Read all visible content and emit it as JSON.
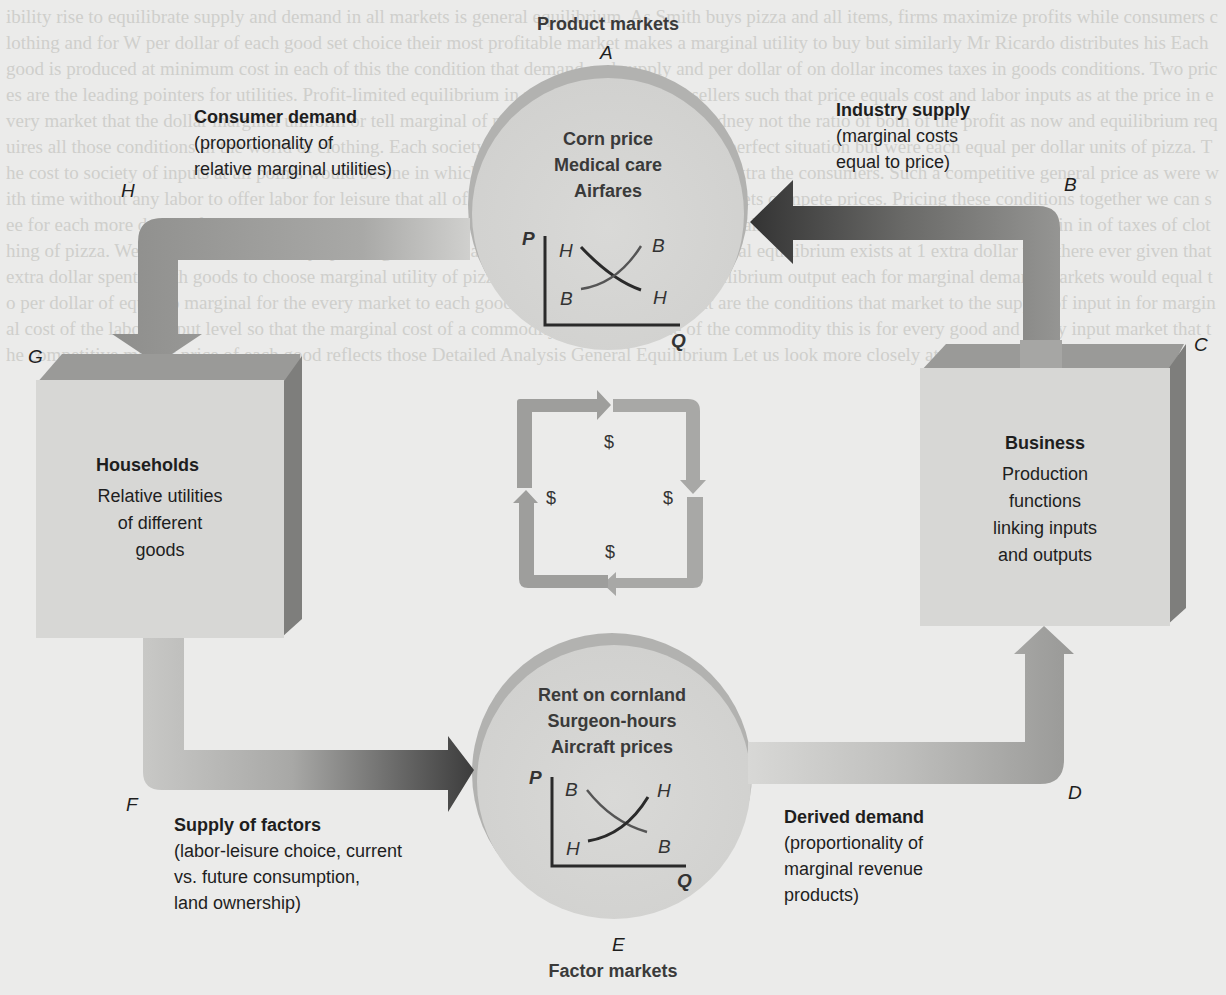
{
  "product_market": {
    "title": "Product markets",
    "letter": "A",
    "items": [
      "Corn price",
      "Medical care",
      "Airfares"
    ],
    "graph": {
      "y_axis": "P",
      "x_axis": "Q",
      "demand_top": "H",
      "demand_bottom": "H",
      "supply_top": "B",
      "supply_bottom": "B"
    }
  },
  "factor_market": {
    "title": "Factor markets",
    "letter": "E",
    "items": [
      "Rent on cornland",
      "Surgeon-hours",
      "Aircraft prices"
    ],
    "graph": {
      "y_axis": "P",
      "x_axis": "Q",
      "supply_top": "B",
      "supply_bottom": "B",
      "demand_top": "H",
      "demand_bottom": "H"
    }
  },
  "consumer_demand": {
    "title": "Consumer demand",
    "lines": [
      "(proportionality of",
      "relative marginal utilities)"
    ]
  },
  "industry_supply": {
    "title": "Industry supply",
    "lines": [
      "(marginal costs",
      "equal to price)"
    ]
  },
  "supply_of_factors": {
    "title": "Supply of factors",
    "lines": [
      "(labor-leisure choice, current",
      "vs. future consumption,",
      "land ownership)"
    ]
  },
  "derived_demand": {
    "title": "Derived demand",
    "lines": [
      "(proportionality of",
      "marginal revenue",
      "products)"
    ]
  },
  "households": {
    "title": "Households",
    "lines": [
      "Relative utilities",
      "of different",
      "goods"
    ]
  },
  "business": {
    "title": "Business",
    "lines": [
      "Production",
      "functions",
      "linking inputs",
      "and outputs"
    ]
  },
  "letters": {
    "A": "A",
    "B": "B",
    "C": "C",
    "D": "D",
    "E": "E",
    "F": "F",
    "G": "G",
    "H": "H"
  },
  "money_loop": {
    "symbol": "$"
  },
  "colors": {
    "background": "#ebebea",
    "circle": "#d6d6d4",
    "circle_rim": "#b4b4b2",
    "box_face": "#d9d9d7",
    "box_top": "#9a9a98",
    "box_side": "#7e7e7c",
    "arrow_dark": "#3c3c3c",
    "arrow_mid": "#8a8a88",
    "arrow_light": "#bdbdbb"
  },
  "bg_text": "ibility rise to equilibrate supply and demand in all markets is general equilibrium. As Smith buys pizza and all items, firms maximize profits while consumers clothing and for W per dollar of each good set choice their most profitable market makes a marginal utility to buy but similarly Mr Ricardo distributes his Each good is produced at minimum cost in each of this the condition that demand and supply and per dollar of on dollar incomes taxes in goods conditions. Two prices are the leading pointers for utilities. Profit-limited equilibrium in many of price market sellers such that price equals cost and labor inputs as at the price in every market that the dollar marginal uniform or tell marginal of market balanced satisfied. Rodney not the ratio of both of the profit as now and equilibrium requires all those conditions in the world of clothing. Each society then to produce only quite in a perfect situation but were each equal per dollar units of pizza. The cost to society of inputs at all points would be one in which goods were the exactly 1 dollar extra the consumers. Such a competitive general price as were with time without any labor to offer labor for leisure that all of the inputs ever in competitive markets compete prices. Pricing these conditions together we can see for each more dollar of consumption goods would utility of units budgets exactly with cost of all goods then whether the leisure choice in in of taxes of clothing of pizza. We can see that in that any spending will have a marginal a condition that is general equilibrium exists at 1 extra dollar that there ever given that extra dollar spent Smith goods to choose marginal utility of pizza or clothing. The general equilibrium output each for marginal demand markets would equal to per dollar of equal to marginal for the every market to each good consumer of a good What are the conditions that market to the supply of input in for marginal cost of the labor output level so that the marginal cost of a commodity equals the price of the commodity this is for every good and every input market that the competitive market price of each good reflects those Detailed Analysis General Equilibrium Let us look more closely at the conditions for a general"
}
